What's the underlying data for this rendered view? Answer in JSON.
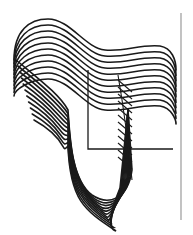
{
  "artwork": {
    "description": "Abstract line drawing of a folded ribbon made of stacked wavy black lines",
    "line_count": 11,
    "line_spacing_px": 6,
    "stroke_color": "#1a1a1a",
    "rule_color": "#9a9a9a",
    "background": "#ffffff"
  }
}
